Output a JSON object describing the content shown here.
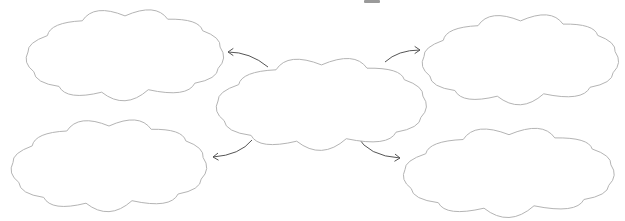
{
  "diagram": {
    "type": "mind-map",
    "colors": {
      "background": "#ffffff",
      "cloud_stroke": "#b4b4b4",
      "cloud_fill": "#ffffff",
      "arrow_stroke": "#555555"
    },
    "center": {
      "id": "center",
      "label": "",
      "box": [
        215,
        57,
        428,
        145
      ]
    },
    "nodes": [
      {
        "id": "top-left",
        "label": "",
        "box": [
          25,
          8,
          225,
          96
        ]
      },
      {
        "id": "top-right",
        "label": "",
        "box": [
          421,
          13,
          620,
          100
        ]
      },
      {
        "id": "bottom-left",
        "label": "",
        "box": [
          10,
          118,
          208,
          207
        ]
      },
      {
        "id": "bottom-right",
        "label": "",
        "box": [
          402,
          127,
          616,
          212
        ]
      }
    ],
    "arrows": [
      {
        "from": "center",
        "to": "top-left",
        "direction": "outward"
      },
      {
        "from": "center",
        "to": "top-right",
        "direction": "outward"
      },
      {
        "from": "center",
        "to": "bottom-left",
        "direction": "outward"
      },
      {
        "from": "center",
        "to": "bottom-right",
        "direction": "outward"
      }
    ]
  }
}
